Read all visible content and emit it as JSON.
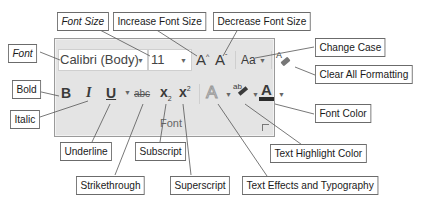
{
  "ribbon_group": {
    "name": "Font",
    "font_name_value": "Calibri (Body)",
    "font_size_value": "11",
    "buttons": {
      "grow_font": "A",
      "shrink_font": "A",
      "change_case": "Aa",
      "bold": "B",
      "italic": "I",
      "underline": "U",
      "strikethrough": "abc",
      "subscript": "x",
      "superscript": "x",
      "text_effects": "A",
      "highlight": "ab",
      "font_color": "A"
    },
    "colors": {
      "panel_bg": "#e4e4e4",
      "font_color_swatch": "#2b2b2b"
    }
  },
  "callouts": {
    "font": "Font",
    "font_size": "Font Size",
    "increase_font_size": "Increase Font Size",
    "decrease_font_size": "Decrease Font Size",
    "change_case": "Change Case",
    "clear_all_formatting": "Clear All Formatting",
    "bold": "Bold",
    "italic": "Italic",
    "underline": "Underline",
    "subscript": "Subscript",
    "strikethrough": "Strikethrough",
    "superscript": "Superscript",
    "text_effects": "Text Effects and Typography",
    "text_highlight_color": "Text Highlight Color",
    "font_color": "Font Color"
  }
}
